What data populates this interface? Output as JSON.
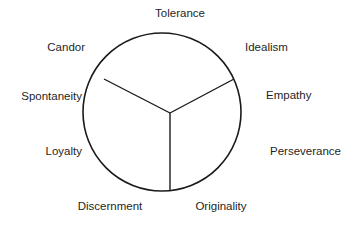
{
  "diagram": {
    "type": "segmented-circle",
    "title": "Tolerance",
    "background_color": "#ffffff",
    "stroke_color": "#1a1a1a",
    "text_color": "#1f1f1f",
    "circle": {
      "cx": 162,
      "cy": 112,
      "r": 79
    },
    "hub": {
      "x": 170,
      "y": 113
    },
    "segment_count": 3,
    "spokes": [
      {
        "name": "spoke-upper-left",
        "x2": 104,
        "y2": 79
      },
      {
        "name": "spoke-upper-right",
        "x2": 234,
        "y2": 79
      },
      {
        "name": "spoke-bottom",
        "x2": 170,
        "y2": 191
      }
    ],
    "labels": [
      {
        "id": "tolerance",
        "text": "Tolerance",
        "x": 180,
        "y": 14,
        "anchor": "mid"
      },
      {
        "id": "candor",
        "text": "Candor",
        "x": 85,
        "y": 48,
        "anchor": "end"
      },
      {
        "id": "idealism",
        "text": "Idealism",
        "x": 245,
        "y": 48,
        "anchor": "start"
      },
      {
        "id": "spontaneity",
        "text": "Spontaneity",
        "x": 82,
        "y": 97,
        "anchor": "end"
      },
      {
        "id": "empathy",
        "text": "Empathy",
        "x": 266,
        "y": 96,
        "anchor": "start"
      },
      {
        "id": "loyalty",
        "text": "Loyalty",
        "x": 82,
        "y": 152,
        "anchor": "end"
      },
      {
        "id": "perseverance",
        "text": "Perseverance",
        "x": 270,
        "y": 152,
        "anchor": "start"
      },
      {
        "id": "discernment",
        "text": "Discernment",
        "x": 110,
        "y": 207,
        "anchor": "mid"
      },
      {
        "id": "originality",
        "text": "Originality",
        "x": 221,
        "y": 207,
        "anchor": "mid"
      }
    ]
  }
}
